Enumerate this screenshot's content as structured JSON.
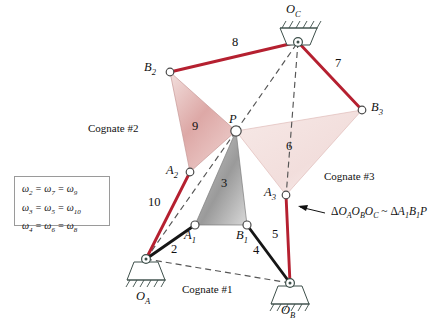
{
  "figure": {
    "colors": {
      "link_red": "#b52030",
      "link_black": "#161616",
      "dashed_gray": "#555555",
      "triangle_gray": "#8d8d8d",
      "triangle_pink": "#d9a3a3",
      "triangle_pale": "#efd6d4",
      "joint_fill": "#ffffff",
      "support_line": "#3d4f4a",
      "text": "#111111"
    }
  },
  "joints": [
    {
      "id": "OA",
      "label": "O",
      "sub": "A",
      "x": 146,
      "y": 259,
      "type": "ground-pivot"
    },
    {
      "id": "OB",
      "label": "O",
      "sub": "B",
      "x": 290,
      "y": 283,
      "type": "ground-pivot"
    },
    {
      "id": "OC",
      "label": "O",
      "sub": "C",
      "x": 298,
      "y": 42,
      "type": "ground-pivot"
    },
    {
      "id": "A1",
      "label": "A",
      "sub": "1",
      "x": 195,
      "y": 225,
      "type": "pin"
    },
    {
      "id": "B1",
      "label": "B",
      "sub": "1",
      "x": 247,
      "y": 225,
      "type": "pin"
    },
    {
      "id": "A2",
      "label": "A",
      "sub": "2",
      "x": 190,
      "y": 172,
      "type": "pin"
    },
    {
      "id": "B2",
      "label": "B",
      "sub": "2",
      "x": 170,
      "y": 72,
      "type": "pin"
    },
    {
      "id": "A3",
      "label": "A",
      "sub": "3",
      "x": 286,
      "y": 195,
      "type": "pin"
    },
    {
      "id": "B3",
      "label": "B",
      "sub": "3",
      "x": 362,
      "y": 110,
      "type": "pin"
    },
    {
      "id": "P",
      "label": "P",
      "sub": "",
      "x": 236,
      "y": 131,
      "type": "coupler-point"
    }
  ],
  "joint_labels": [
    {
      "name": "label-OA",
      "text": "O",
      "sub": "A",
      "x": 138,
      "y": 296
    },
    {
      "name": "label-OB",
      "text": "O",
      "sub": "B",
      "x": 282,
      "y": 308
    },
    {
      "name": "label-OC",
      "text": "O",
      "sub": "C",
      "x": 288,
      "y": 5
    },
    {
      "name": "label-A1",
      "text": "A",
      "sub": "1",
      "x": 186,
      "y": 237
    },
    {
      "name": "label-B1",
      "text": "B",
      "sub": "1",
      "x": 238,
      "y": 237
    },
    {
      "name": "label-A2",
      "text": "A",
      "sub": "2",
      "x": 163,
      "y": 165
    },
    {
      "name": "label-B2",
      "text": "B",
      "sub": "2",
      "x": 143,
      "y": 62
    },
    {
      "name": "label-A3",
      "text": "A",
      "sub": "3",
      "x": 262,
      "y": 189
    },
    {
      "name": "label-B3",
      "text": "B",
      "sub": "3",
      "x": 372,
      "y": 103
    },
    {
      "name": "label-P",
      "text": "P",
      "sub": "",
      "x": 229,
      "y": 116
    }
  ],
  "link_numbers": [
    {
      "name": "link-number-2",
      "text": "2",
      "x": 173,
      "y": 249
    },
    {
      "name": "link-number-3",
      "text": "3",
      "x": 224,
      "y": 183
    },
    {
      "name": "link-number-4",
      "text": "4",
      "x": 255,
      "y": 250
    },
    {
      "name": "link-number-5",
      "text": "5",
      "x": 274,
      "y": 234
    },
    {
      "name": "link-number-6",
      "text": "6",
      "x": 288,
      "y": 146
    },
    {
      "name": "link-number-7",
      "text": "7",
      "x": 337,
      "y": 63
    },
    {
      "name": "link-number-8",
      "text": "8",
      "x": 234,
      "y": 42
    },
    {
      "name": "link-number-9",
      "text": "9",
      "x": 194,
      "y": 126
    },
    {
      "name": "link-number-10",
      "text": "10",
      "x": 153,
      "y": 202
    }
  ],
  "cognate_labels": [
    {
      "name": "cognate-label-1",
      "text": "Cognate #1",
      "x": 185,
      "y": 290
    },
    {
      "name": "cognate-label-2",
      "text": "Cognate #2",
      "x": 88,
      "y": 128
    },
    {
      "name": "cognate-label-3",
      "text": "Cognate #3",
      "x": 325,
      "y": 176
    }
  ],
  "omega_box": {
    "lines": [
      {
        "terms": [
          {
            "w": "ω",
            "sub": "2"
          },
          {
            "w": "ω",
            "sub": "7"
          },
          {
            "w": "ω",
            "sub": "9"
          }
        ]
      },
      {
        "terms": [
          {
            "w": "ω",
            "sub": "3"
          },
          {
            "w": "ω",
            "sub": "5"
          },
          {
            "w": "ω",
            "sub": "10"
          }
        ]
      },
      {
        "terms": [
          {
            "w": "ω",
            "sub": "4"
          },
          {
            "w": "ω",
            "sub": "6"
          },
          {
            "w": "ω",
            "sub": "8"
          }
        ]
      }
    ],
    "line_text": [
      "ω₂ = ω₇ = ω₉",
      "ω₃ = ω₅ = ω₁₀",
      "ω₄ = ω₆ = ω₈"
    ]
  },
  "similarity_note": {
    "name": "similarity-annotation",
    "text": "ΔOₐOᵇOᶜ ~ ΔA₁B₁P",
    "parts": {
      "delta1": "Δ",
      "O": "O",
      "subA": "A",
      "subB": "B",
      "subC": "C",
      "delta2": "Δ",
      "A": "A",
      "sub1": "1",
      "B": "B",
      "tilde": "~",
      "P": "P"
    },
    "x": 330,
    "y": 213
  },
  "triangles": [
    {
      "name": "coupler-triangle-3",
      "vertices": "A1,B1,P",
      "label": "3",
      "fill": "gray"
    },
    {
      "name": "coupler-triangle-9",
      "vertices": "A2,B2,P",
      "label": "9",
      "fill": "pink"
    },
    {
      "name": "coupler-triangle-6",
      "vertices": "A3,B3,P",
      "label": "6",
      "fill": "pale"
    }
  ],
  "links": [
    {
      "name": "link-2",
      "from": "OA",
      "to": "A1",
      "style": "solid-black"
    },
    {
      "name": "link-4",
      "from": "OB",
      "to": "B1",
      "style": "solid-black"
    },
    {
      "name": "link-10",
      "from": "OA",
      "to": "A2",
      "style": "solid-red"
    },
    {
      "name": "link-8",
      "from": "B2",
      "to": "OC",
      "style": "solid-red"
    },
    {
      "name": "link-7",
      "from": "OC",
      "to": "B3",
      "style": "solid-red"
    },
    {
      "name": "link-5",
      "from": "A3",
      "to": "OB",
      "style": "solid-red"
    }
  ],
  "construction_lines": [
    {
      "name": "dashed-OA-OB",
      "from": "OA",
      "to": "OB"
    },
    {
      "name": "dashed-OA-P",
      "from": "OA",
      "to": "P"
    },
    {
      "name": "dashed-P-OC",
      "from": "P",
      "to": "OC"
    },
    {
      "name": "dashed-OC-A3",
      "from": "OC",
      "to": "A3"
    }
  ]
}
